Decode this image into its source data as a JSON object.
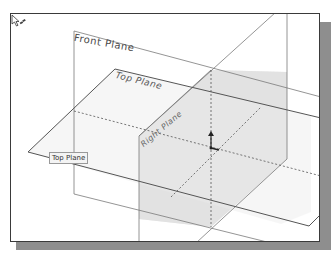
{
  "viewport": {
    "title": "3D Graphics Area",
    "planes": [
      {
        "id": "front",
        "label": "Front Plane"
      },
      {
        "id": "top",
        "label": "Top Plane"
      },
      {
        "id": "right",
        "label": "Right Plane"
      }
    ],
    "tooltip": "Top Plane",
    "hovered_plane": "Top Plane",
    "cursor_icon": "select-plane-cursor",
    "origin_icon": "origin-triad"
  },
  "colors": {
    "viewport_bg": "#ffffff",
    "plane_edge": "#6a6a6a",
    "plane_fill": "#e9e9e9",
    "shadow": "#8e8e8e",
    "frame": "#3a3a3a"
  }
}
